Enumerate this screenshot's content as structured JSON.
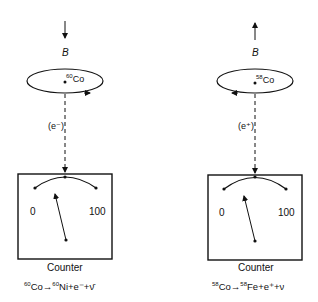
{
  "panels": [
    {
      "field_label": "B",
      "field_direction": "down",
      "isotope_mass": "60",
      "isotope_symbol": "Co",
      "emitted_particle": "(e⁻)",
      "rotation": "counterclockwise-front",
      "dial_min": "0",
      "dial_max": "100",
      "counter_label": "Counter",
      "equation": {
        "parent_mass": "60",
        "parent": "Co",
        "arrow": "→",
        "daughter_mass": "60",
        "daughter": "Ni",
        "rest": "+e⁻+ν̄"
      }
    },
    {
      "field_label": "B",
      "field_direction": "up",
      "isotope_mass": "58",
      "isotope_symbol": "Co",
      "emitted_particle": "(e⁺)",
      "rotation": "clockwise-front",
      "dial_min": "0",
      "dial_max": "100",
      "counter_label": "Counter",
      "equation": {
        "parent_mass": "58",
        "parent": "Co",
        "arrow": "→",
        "daughter_mass": "58",
        "daughter": "Fe",
        "rest": "+e⁺+ν"
      }
    }
  ]
}
